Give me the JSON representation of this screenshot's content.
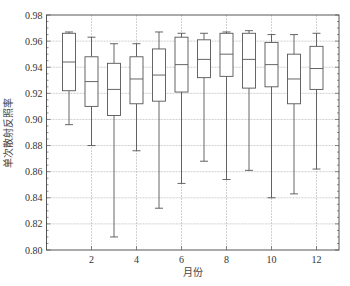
{
  "chart_data": {
    "type": "box",
    "title": "",
    "xlabel": "月份",
    "ylabel": "单次散射反照率",
    "xlim": [
      0,
      13
    ],
    "ylim": [
      0.8,
      0.98
    ],
    "x_ticks": [
      2,
      4,
      6,
      8,
      10,
      12
    ],
    "x_tick_labels": [
      "2",
      "4",
      "6",
      "8",
      "10",
      "12"
    ],
    "y_ticks": [
      0.8,
      0.82,
      0.84,
      0.86,
      0.88,
      0.9,
      0.92,
      0.94,
      0.96,
      0.98
    ],
    "y_tick_labels": [
      "0.80",
      "0.82",
      "0.84",
      "0.86",
      "0.88",
      "0.90",
      "0.92",
      "0.94",
      "0.96",
      "0.98"
    ],
    "grid": true,
    "legend": null,
    "categories": [
      1,
      2,
      3,
      4,
      5,
      6,
      7,
      8,
      9,
      10,
      11,
      12
    ],
    "series": [
      {
        "month": 1,
        "whisker_low": 0.896,
        "q1": 0.922,
        "median": 0.944,
        "q3": 0.966,
        "whisker_high": 0.967
      },
      {
        "month": 2,
        "whisker_low": 0.88,
        "q1": 0.91,
        "median": 0.929,
        "q3": 0.948,
        "whisker_high": 0.963
      },
      {
        "month": 3,
        "whisker_low": 0.81,
        "q1": 0.903,
        "median": 0.923,
        "q3": 0.943,
        "whisker_high": 0.958
      },
      {
        "month": 4,
        "whisker_low": 0.876,
        "q1": 0.912,
        "median": 0.931,
        "q3": 0.948,
        "whisker_high": 0.958
      },
      {
        "month": 5,
        "whisker_low": 0.832,
        "q1": 0.914,
        "median": 0.934,
        "q3": 0.954,
        "whisker_high": 0.967
      },
      {
        "month": 6,
        "whisker_low": 0.851,
        "q1": 0.921,
        "median": 0.942,
        "q3": 0.963,
        "whisker_high": 0.966
      },
      {
        "month": 7,
        "whisker_low": 0.868,
        "q1": 0.932,
        "median": 0.946,
        "q3": 0.961,
        "whisker_high": 0.966
      },
      {
        "month": 8,
        "whisker_low": 0.854,
        "q1": 0.933,
        "median": 0.95,
        "q3": 0.966,
        "whisker_high": 0.967
      },
      {
        "month": 9,
        "whisker_low": 0.861,
        "q1": 0.924,
        "median": 0.946,
        "q3": 0.966,
        "whisker_high": 0.968
      },
      {
        "month": 10,
        "whisker_low": 0.84,
        "q1": 0.925,
        "median": 0.942,
        "q3": 0.959,
        "whisker_high": 0.965
      },
      {
        "month": 11,
        "whisker_low": 0.843,
        "q1": 0.912,
        "median": 0.931,
        "q3": 0.95,
        "whisker_high": 0.965
      },
      {
        "month": 12,
        "whisker_low": 0.862,
        "q1": 0.923,
        "median": 0.939,
        "q3": 0.956,
        "whisker_high": 0.966
      }
    ]
  },
  "style": {
    "box_color": "#555555",
    "grid_color": "#bbbbbb",
    "axis_color": "#444444"
  }
}
